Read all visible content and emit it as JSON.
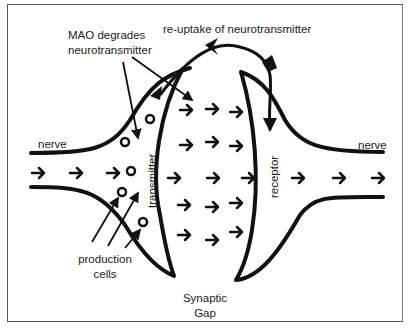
{
  "diagram": {
    "labels": {
      "mao": [
        "MAO degrades",
        "neurotransmitter"
      ],
      "reuptake": "re-uptake of neurotransmitter",
      "nerve_left": "nerve",
      "nerve_right": "nerve",
      "transmitter": "transmitter",
      "receptor": "receptor",
      "production": [
        "production",
        "cells"
      ],
      "gap": [
        "Synaptic",
        "Gap"
      ]
    },
    "colors": {
      "ink": "#111111",
      "border": "#555555",
      "background": "#ffffff"
    },
    "arrow_glyph": "→"
  }
}
